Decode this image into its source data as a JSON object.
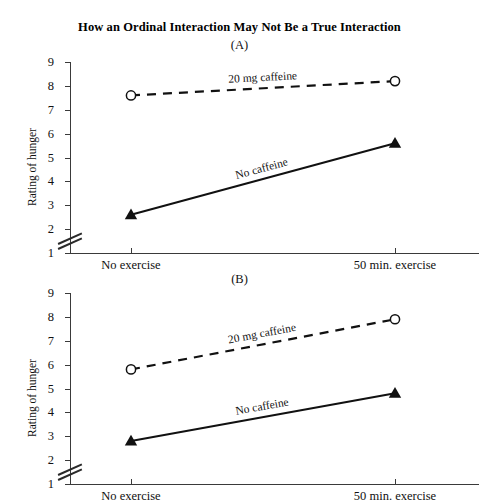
{
  "figure": {
    "title": "How an Ordinal Interaction May Not Be a True Interaction"
  },
  "chart_data": [
    {
      "type": "line",
      "panel": "(A)",
      "title": "How an Ordinal Interaction May Not Be a True Interaction",
      "xlabel": "",
      "ylabel": "Rating of hunger",
      "categories": [
        "No exercise",
        "50 min. exercise"
      ],
      "yticks": [
        1,
        2,
        3,
        4,
        5,
        6,
        7,
        8,
        9
      ],
      "ylim": [
        1,
        9
      ],
      "axis_break": "between 1 and 2",
      "grid": false,
      "legend": "inline-labels",
      "series": [
        {
          "name": "20 mg caffeine",
          "values": [
            7.6,
            8.2
          ],
          "marker": "open-circle",
          "line": "dashed"
        },
        {
          "name": "No caffeine",
          "values": [
            2.6,
            5.6
          ],
          "marker": "filled-triangle",
          "line": "solid"
        }
      ]
    },
    {
      "type": "line",
      "panel": "(B)",
      "xlabel": "",
      "ylabel": "Rating of hunger",
      "categories": [
        "No exercise",
        "50 min. exercise"
      ],
      "yticks": [
        1,
        2,
        3,
        4,
        5,
        6,
        7,
        8,
        9
      ],
      "ylim": [
        1,
        9
      ],
      "axis_break": "between 1 and 2",
      "grid": false,
      "legend": "inline-labels",
      "series": [
        {
          "name": "20 mg caffeine",
          "values": [
            5.8,
            7.9
          ],
          "marker": "open-circle",
          "line": "dashed"
        },
        {
          "name": "No caffeine",
          "values": [
            2.8,
            4.8
          ],
          "marker": "filled-triangle",
          "line": "solid"
        }
      ]
    }
  ],
  "colors": {
    "ink": "#111111",
    "axis": "#3a3a3a",
    "background": "#ffffff"
  }
}
